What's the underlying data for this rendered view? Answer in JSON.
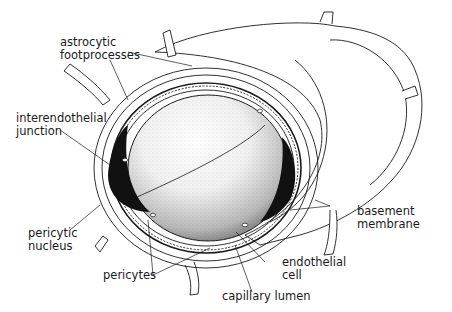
{
  "diagram": {
    "colors": {
      "ink": "#1a1a1a",
      "background": "#ffffff",
      "nucleus": "#111111"
    },
    "labels": {
      "astrocytic": {
        "line1": "astrocytic",
        "line2": "footprocesses"
      },
      "interendothelial": {
        "line1": "interendothelial",
        "line2": "junction"
      },
      "pericytic_nucleus": {
        "line1": "pericytic",
        "line2": "nucleus"
      },
      "pericytes": {
        "line1": "pericytes"
      },
      "capillary_lumen": {
        "line1": "capillary lumen"
      },
      "endothelial_cell": {
        "line1": "endothelial",
        "line2": "cell"
      },
      "basement_membrane": {
        "line1": "basement",
        "line2": "membrane"
      }
    }
  }
}
